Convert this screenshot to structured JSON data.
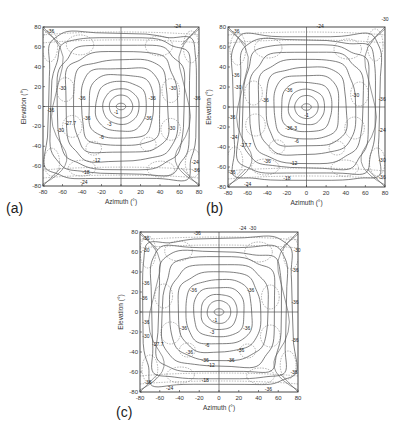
{
  "chart_data": [
    {
      "id": "a",
      "panel_label": "(a)",
      "type": "contour",
      "title": "",
      "xlabel": "Azimuth (°)",
      "ylabel": "Elevation (°)",
      "xlim": [
        -80,
        80
      ],
      "ylim": [
        -80,
        80
      ],
      "xticks": [
        -80,
        -60,
        -40,
        -20,
        0,
        20,
        40,
        60,
        80
      ],
      "yticks": [
        80,
        60,
        40,
        20,
        0,
        -20,
        -40,
        -60,
        -80
      ],
      "grid": "crosshair at 0,0",
      "contour_levels_solid": [
        -1,
        -3,
        -6,
        -12,
        -18,
        -24
      ],
      "contour_levels_dashed": [
        -27.7,
        -30,
        -36
      ],
      "contour_labels": [
        {
          "text": "-1",
          "az": -5,
          "el": -8
        },
        {
          "text": "-3",
          "az": -12,
          "el": -20
        },
        {
          "text": "-6",
          "az": -20,
          "el": -33
        },
        {
          "text": "-12",
          "az": -25,
          "el": -56
        },
        {
          "text": "-18",
          "az": -36,
          "el": -68
        },
        {
          "text": "-24",
          "az": -38,
          "el": -78
        },
        {
          "text": "-24",
          "az": 58,
          "el": 79
        },
        {
          "text": "-36",
          "az": -72,
          "el": 74
        },
        {
          "text": "-30",
          "az": -60,
          "el": 17
        },
        {
          "text": "-30",
          "az": 53,
          "el": 17
        },
        {
          "text": "-36",
          "az": -40,
          "el": 7
        },
        {
          "text": "-36",
          "az": 32,
          "el": 7
        },
        {
          "text": "-36",
          "az": -72,
          "el": -6
        },
        {
          "text": "-36",
          "az": -35,
          "el": -14
        },
        {
          "text": "-36",
          "az": 28,
          "el": -14
        },
        {
          "text": "-27.7",
          "az": -52,
          "el": -19
        },
        {
          "text": "-30",
          "az": -62,
          "el": -26
        },
        {
          "text": "-30",
          "az": 52,
          "el": -24
        },
        {
          "text": "-36",
          "az": 78,
          "el": 7
        },
        {
          "text": "-24",
          "az": 76,
          "el": -58
        },
        {
          "text": "-36",
          "az": 77,
          "el": -66
        }
      ]
    },
    {
      "id": "b",
      "panel_label": "(b)",
      "type": "contour",
      "title": "",
      "xlabel": "Azimuth (°)",
      "ylabel": "Elevation (°)",
      "xlim": [
        -80,
        80
      ],
      "ylim": [
        -80,
        80
      ],
      "xticks": [
        -80,
        -60,
        -40,
        -20,
        0,
        20,
        40,
        60,
        80
      ],
      "yticks": [
        80,
        60,
        40,
        20,
        0,
        -20,
        -40,
        -60,
        -80
      ],
      "grid": "crosshair at 0,0",
      "contour_levels_solid": [
        -1,
        -3,
        -6,
        -12,
        -18,
        -24
      ],
      "contour_levels_dashed": [
        -27.7,
        -30,
        -36
      ],
      "contour_labels": [
        {
          "text": "-1",
          "az": 0,
          "el": -10
        },
        {
          "text": "-3",
          "az": -12,
          "el": -23
        },
        {
          "text": "-6",
          "az": -10,
          "el": -36
        },
        {
          "text": "-12",
          "az": -13,
          "el": -58
        },
        {
          "text": "-18",
          "az": -20,
          "el": -73
        },
        {
          "text": "-24",
          "az": 14,
          "el": 79
        },
        {
          "text": "-36",
          "az": -72,
          "el": 74
        },
        {
          "text": "-30",
          "az": 80,
          "el": 86
        },
        {
          "text": "-36",
          "az": -72,
          "el": 30
        },
        {
          "text": "-30",
          "az": -70,
          "el": 18
        },
        {
          "text": "-36",
          "az": -42,
          "el": 5
        },
        {
          "text": "-36",
          "az": -18,
          "el": 15
        },
        {
          "text": "-30",
          "az": 50,
          "el": 10
        },
        {
          "text": "-36",
          "az": 77,
          "el": 6
        },
        {
          "text": "-36",
          "az": -76,
          "el": -12
        },
        {
          "text": "-36",
          "az": -18,
          "el": -23
        },
        {
          "text": "-24",
          "az": -74,
          "el": -32
        },
        {
          "text": "-27.7",
          "az": -62,
          "el": -40
        },
        {
          "text": "-36",
          "az": -40,
          "el": -56
        },
        {
          "text": "-36",
          "az": -76,
          "el": -67
        },
        {
          "text": "-24",
          "az": -60,
          "el": -79
        },
        {
          "text": "-24",
          "az": 77,
          "el": -25
        },
        {
          "text": "-30",
          "az": 77,
          "el": -55
        },
        {
          "text": "-36",
          "az": 77,
          "el": -72
        }
      ]
    },
    {
      "id": "c",
      "panel_label": "(c)",
      "type": "contour",
      "title": "",
      "xlabel": "Azimuth (°)",
      "ylabel": "Elevation (°)",
      "xlim": [
        -80,
        80
      ],
      "ylim": [
        -80,
        80
      ],
      "xticks": [
        -80,
        -60,
        -40,
        -20,
        0,
        20,
        40,
        60,
        80
      ],
      "yticks": [
        80,
        60,
        40,
        20,
        0,
        -20,
        -40,
        -60,
        -80
      ],
      "grid": "crosshair at 0,0",
      "contour_levels_solid": [
        -1,
        -3,
        -6,
        -12,
        -18,
        -24
      ],
      "contour_levels_dashed": [
        -27.7,
        -30,
        -36
      ],
      "contour_labels": [
        {
          "text": "-1",
          "az": -4,
          "el": -10
        },
        {
          "text": "-3",
          "az": -7,
          "el": -22
        },
        {
          "text": "-6",
          "az": -12,
          "el": -35
        },
        {
          "text": "-12",
          "az": -8,
          "el": -55
        },
        {
          "text": "-18",
          "az": -14,
          "el": -70
        },
        {
          "text": "-24",
          "az": 24,
          "el": 82
        },
        {
          "text": "-30",
          "az": 34,
          "el": 82
        },
        {
          "text": "-36",
          "az": -22,
          "el": 77
        },
        {
          "text": "-36",
          "az": -26,
          "el": 20
        },
        {
          "text": "-36",
          "az": 32,
          "el": 20
        },
        {
          "text": "-36",
          "az": -74,
          "el": 72
        },
        {
          "text": "-30",
          "az": -74,
          "el": 60
        },
        {
          "text": "-36",
          "az": -74,
          "el": 27
        },
        {
          "text": "-36",
          "az": -76,
          "el": 12
        },
        {
          "text": "-36",
          "az": -74,
          "el": -12
        },
        {
          "text": "-30",
          "az": -74,
          "el": -26
        },
        {
          "text": "-27.7",
          "az": -62,
          "el": -34
        },
        {
          "text": "-36",
          "az": -36,
          "el": -18
        },
        {
          "text": "-36",
          "az": 28,
          "el": -18
        },
        {
          "text": "-36",
          "az": -30,
          "el": -42
        },
        {
          "text": "-36",
          "az": 22,
          "el": -40
        },
        {
          "text": "-36",
          "az": -14,
          "el": -50
        },
        {
          "text": "-36",
          "az": 12,
          "el": -50
        },
        {
          "text": "-30",
          "az": 79,
          "el": 60
        },
        {
          "text": "-36",
          "az": 77,
          "el": 40
        },
        {
          "text": "-36",
          "az": 77,
          "el": 8
        },
        {
          "text": "-36",
          "az": 77,
          "el": -30
        },
        {
          "text": "-36",
          "az": 76,
          "el": -62
        },
        {
          "text": "-36",
          "az": -72,
          "el": -72
        },
        {
          "text": "-24",
          "az": -50,
          "el": -78
        },
        {
          "text": "-36",
          "az": 50,
          "el": -79
        }
      ]
    }
  ],
  "panels": [
    {
      "label": "(a)",
      "left": 0,
      "top": 0,
      "box": {
        "x": 43,
        "y": 27,
        "w": 156,
        "h": 159
      },
      "label_pos": {
        "x": 6,
        "y": 200
      }
    },
    {
      "label": "(b)",
      "left": 0,
      "top": 0,
      "box": {
        "x": 228,
        "y": 27,
        "w": 157,
        "h": 160
      },
      "label_pos": {
        "x": 206,
        "y": 200
      }
    },
    {
      "label": "(c)",
      "left": 0,
      "top": 0,
      "box": {
        "x": 140,
        "y": 232,
        "w": 158,
        "h": 160
      },
      "label_pos": {
        "x": 116,
        "y": 404
      }
    }
  ],
  "axes": {
    "xlabel": "Azimuth (°)",
    "ylabel": "Elevation (°)"
  }
}
